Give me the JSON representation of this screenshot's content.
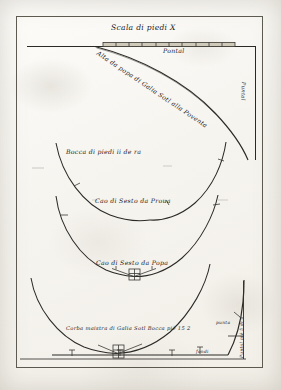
{
  "document": {
    "kind": "manuscript-technical-drawing",
    "subject": "Venetian galley hull body-plan sections",
    "language": "Italian (archaic)",
    "ink_color": "#2b2a26",
    "paper_color": "#f6f4ef"
  },
  "frame": {
    "label": "drawing-border"
  },
  "scale": {
    "title": "Scala di piedi X",
    "bar_label": "Pontal",
    "tick_count": 10
  },
  "annotations": [
    {
      "id": "alta-da-popa",
      "text": "Alta da popa di Galia Sotl alla Poventa",
      "kind": "curve-label-rotated"
    },
    {
      "id": "puntal-vertical",
      "text": "Puntal",
      "kind": "vertical-label"
    },
    {
      "id": "bocca-di-piedi",
      "text": "Bocca di piedi ii de ra",
      "kind": "curve-label"
    },
    {
      "id": "cao-sesto-prova",
      "text": "Cao di Sesto da Proua",
      "kind": "curve-label"
    },
    {
      "id": "cao-sesto-popa",
      "text": "Cao di Sesto da Popa",
      "kind": "curve-label"
    },
    {
      "id": "corba-maistra",
      "text": "Corba maistra di Galia Sotl Bocca piè 15 2",
      "kind": "curve-label"
    },
    {
      "id": "fondi",
      "text": "fondi",
      "kind": "small-label"
    },
    {
      "id": "puntal-piedi",
      "text": "Puntal piè 5 di 4",
      "kind": "vertical-label"
    },
    {
      "id": "punta-corner",
      "text": "punta",
      "kind": "tiny-label"
    }
  ],
  "sections": [
    {
      "id": "section-top",
      "name": "stern-sheer-curve",
      "label_ref": "alta-da-popa"
    },
    {
      "id": "section-second",
      "name": "upper-body-section",
      "label_ref": "bocca-di-piedi"
    },
    {
      "id": "section-third",
      "name": "bow-sesto-section",
      "label_ref": "cao-sesto-prova"
    },
    {
      "id": "section-fourth",
      "name": "stern-sesto-section",
      "label_ref": "cao-sesto-popa"
    },
    {
      "id": "section-bottom",
      "name": "midship-frame",
      "label_ref": "corba-maistra"
    }
  ]
}
